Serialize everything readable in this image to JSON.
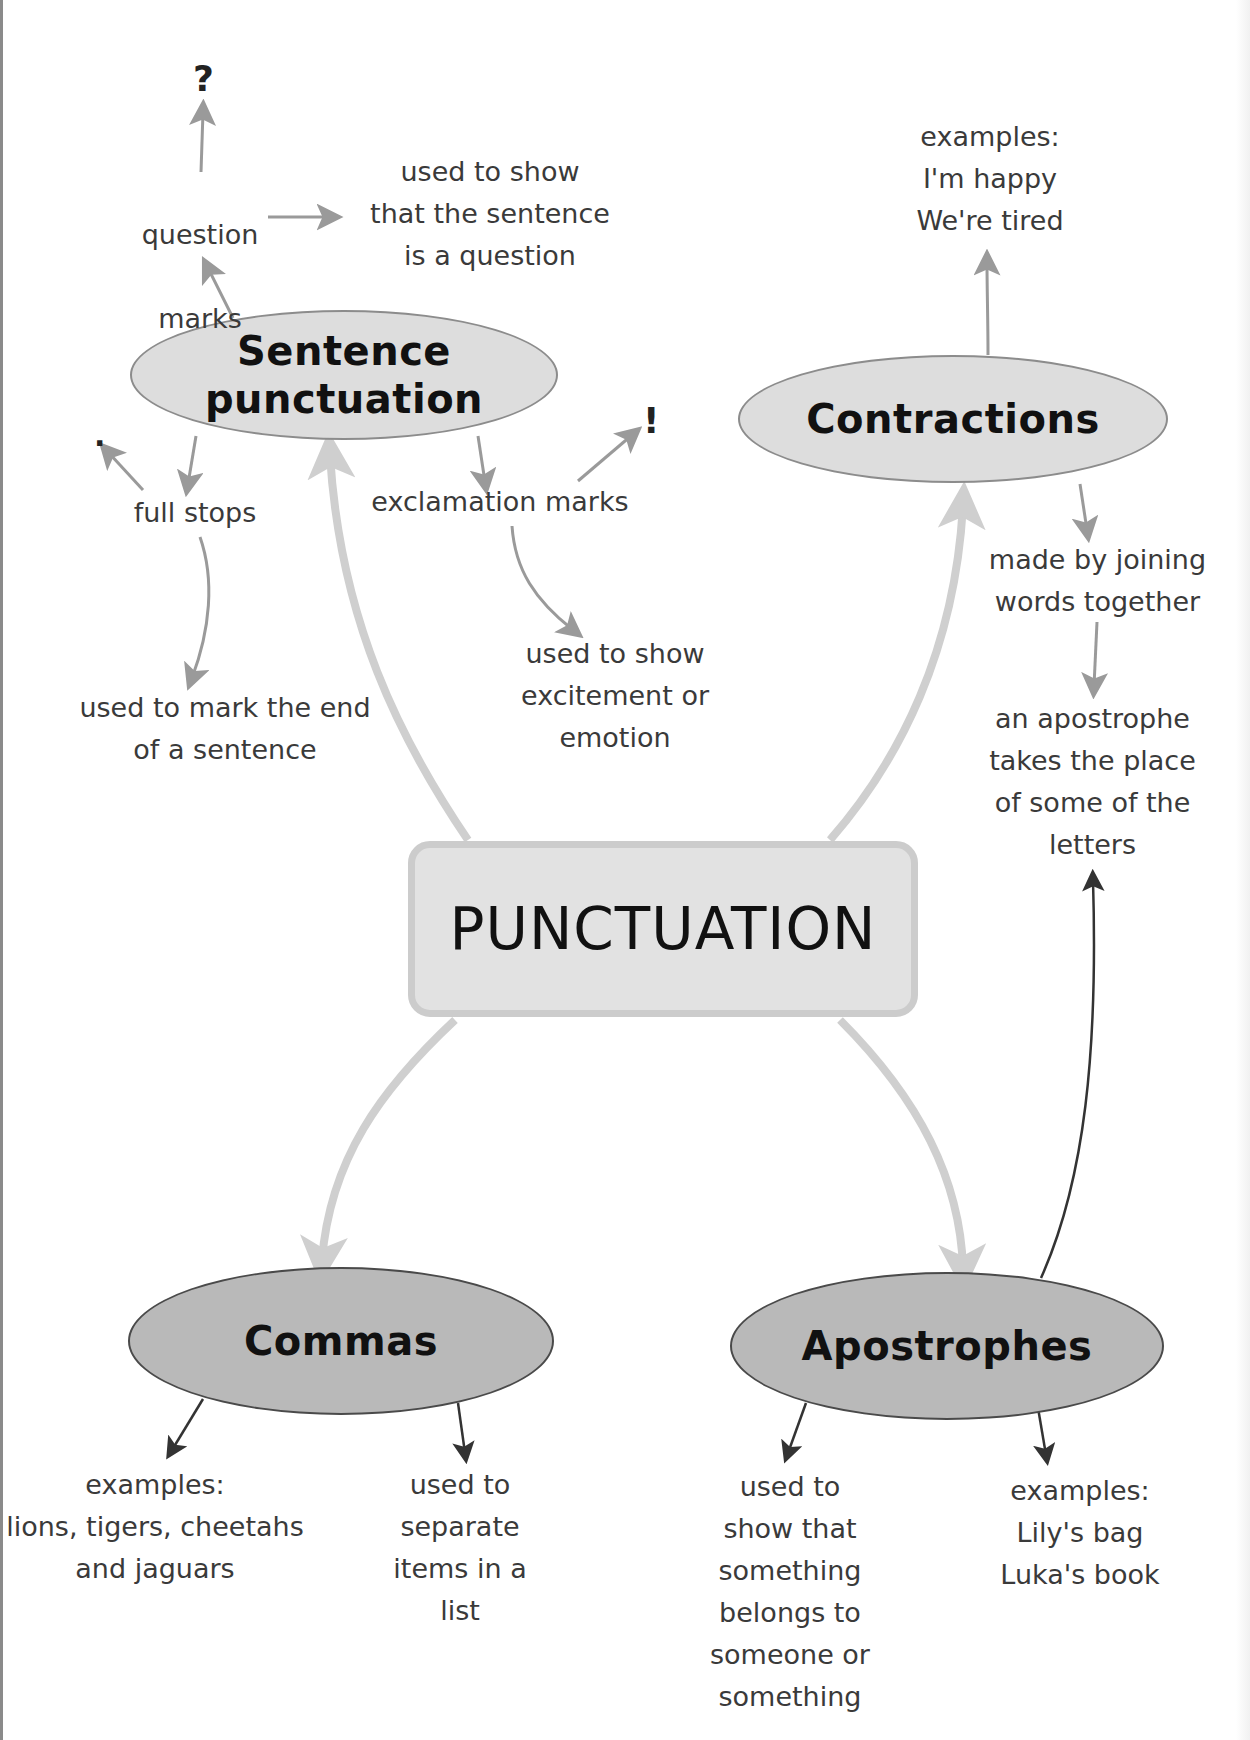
{
  "diagram": {
    "center": {
      "label": "PUNCTUATION"
    },
    "branches": [
      {
        "id": "sentence-punctuation",
        "label": "Sentence\npunctuation",
        "label_line1": "Sentence",
        "label_line2": "punctuation",
        "children": [
          {
            "label": "question marks",
            "label_line1": "question",
            "label_line2": "marks",
            "symbol": "?",
            "description": "used to show\nthat the sentence\nis a question"
          },
          {
            "label": "full stops",
            "symbol": ".",
            "description": "used to mark the end\nof a sentence"
          },
          {
            "label": "exclamation marks",
            "symbol": "!",
            "description": "used to show\nexcitement or\nemotion"
          }
        ]
      },
      {
        "id": "contractions",
        "label": "Contractions",
        "examples": "examples:\nI'm happy\nWe're tired",
        "description": "made by joining\nwords together",
        "detail": "an apostrophe\ntakes the place\nof some of the\nletters"
      },
      {
        "id": "commas",
        "label": "Commas",
        "examples": "examples:\nlions, tigers, cheetahs\nand jaguars",
        "description": "used to\nseparate\nitems in a\nlist"
      },
      {
        "id": "apostrophes",
        "label": "Apostrophes",
        "description": "used to\nshow that\nsomething\nbelongs to\nsomeone or\nsomething",
        "examples": "examples:\nLily's bag\nLuka's book"
      }
    ]
  },
  "colors": {
    "light_node_fill": "#dddddd",
    "dark_node_fill": "#b9b9b9",
    "center_fill": "#e2e2e2",
    "center_border": "#cccccc",
    "main_arrow": "#cfcfcf",
    "minor_arrow": "#9a9a9a",
    "dark_arrow": "#333333",
    "text": "#3a3a3a"
  }
}
